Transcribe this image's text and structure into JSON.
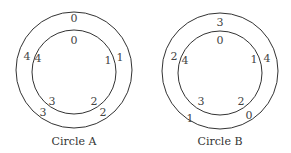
{
  "diagram": {
    "circles": [
      {
        "caption": "Circle A",
        "outer": [
          "0",
          "1",
          "2",
          "3",
          "4"
        ],
        "inner": [
          "0",
          "1",
          "2",
          "3",
          "4"
        ]
      },
      {
        "caption": "Circle B",
        "outer": [
          "3",
          "4",
          "0",
          "1",
          "2"
        ],
        "inner": [
          "0",
          "1",
          "2",
          "3",
          "4"
        ]
      }
    ]
  }
}
